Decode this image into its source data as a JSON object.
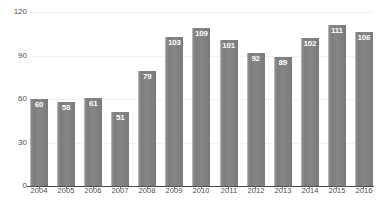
{
  "chart_data": {
    "type": "bar",
    "title": "",
    "xlabel": "",
    "ylabel": "",
    "categories": [
      "2004",
      "2005",
      "2006",
      "2007",
      "2008",
      "2009",
      "2010",
      "2011",
      "2012",
      "2013",
      "2014",
      "2015",
      "2016"
    ],
    "values": [
      60,
      58,
      61,
      51,
      79,
      103,
      109,
      101,
      92,
      89,
      102,
      111,
      106
    ],
    "value_labels": [
      "60",
      "58",
      "61",
      "51",
      "79",
      "103",
      "109",
      "101",
      "92",
      "89",
      "102",
      "111",
      "106"
    ],
    "ylim": [
      0,
      120
    ],
    "yticks": [
      0,
      30,
      60,
      90,
      120
    ],
    "ytick_labels": [
      "0",
      "30",
      "60",
      "90",
      "120"
    ],
    "grid": true,
    "legend": "none",
    "colors": {
      "bar_fill": "#828282",
      "bar_highlight": "#b4b4b4",
      "value_text": "#ffffff",
      "axis_line": "#4a4a4a",
      "gridline": "#f2f2f2",
      "tick_text": "#4d4d4d",
      "background": "#ffffff"
    }
  }
}
